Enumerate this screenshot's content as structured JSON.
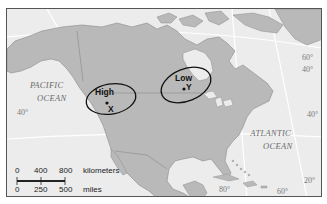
{
  "map": {
    "region": "North America",
    "colors": {
      "ocean": "#ececec",
      "land": "#b9b9b9",
      "border": "#7a7a7a",
      "graticule": "#ffffff",
      "ellipse": "#111111"
    },
    "oceans": [
      {
        "id": "pacific",
        "line1": "PACIFIC",
        "line2": "OCEAN"
      },
      {
        "id": "atlantic",
        "line1": "ATLANTIC",
        "line2": "OCEAN"
      }
    ],
    "latitude_labels": {
      "lat60_east": "60°",
      "lat40_east": "40°",
      "lat40_west": "40°",
      "lat40_atlantic": "40°",
      "lat20": "20°"
    },
    "longitude_labels": {
      "lon80": "80°",
      "lon60": "60°"
    },
    "pressure_systems": [
      {
        "type": "High",
        "point": "X"
      },
      {
        "type": "Low",
        "point": "Y"
      }
    ],
    "scale": {
      "km_ticks": [
        "0",
        "400",
        "800"
      ],
      "km_unit": "kilometers",
      "mi_ticks": [
        "0",
        "250",
        "500"
      ],
      "mi_unit": "miles"
    }
  }
}
